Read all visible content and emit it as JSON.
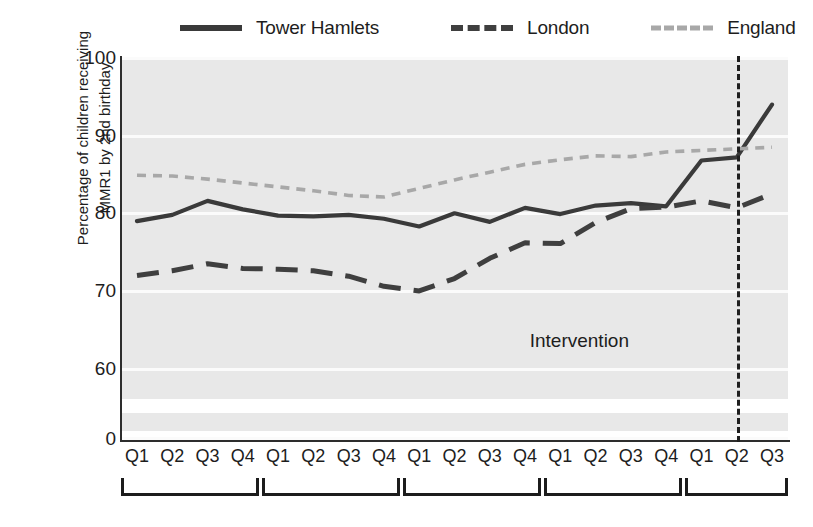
{
  "legend": {
    "entries": [
      {
        "label": "Tower Hamlets",
        "style": "solid",
        "color": "#3a3a3a",
        "icon": "solid-line-swatch"
      },
      {
        "label": "London",
        "style": "dashed",
        "color": "#3f3f3f",
        "icon": "dashed-line-swatch"
      },
      {
        "label": "England",
        "style": "dotted",
        "color": "#a8a8a8",
        "icon": "dotted-line-swatch"
      }
    ]
  },
  "axis": {
    "ylabel_line1": "Percentage of children receiving",
    "ylabel_line2": "MMR1 by 2nd birthday",
    "yticks": [
      "100",
      "90",
      "80",
      "70",
      "60",
      "0"
    ],
    "xticks": [
      "Q1",
      "Q2",
      "Q3",
      "Q4",
      "Q1",
      "Q2",
      "Q3",
      "Q4",
      "Q1",
      "Q2",
      "Q3",
      "Q4",
      "Q1",
      "Q2",
      "Q3",
      "Q4",
      "Q1",
      "Q2",
      "Q3"
    ]
  },
  "annotations": {
    "intervention_label": "Intervention"
  },
  "chart_data": {
    "type": "line",
    "title": "",
    "xlabel": "",
    "ylabel": "Percentage of children receiving MMR1 by 2nd birthday",
    "ylim": [
      57.5,
      100
    ],
    "ytick_values": [
      100,
      90,
      80,
      70,
      60,
      0
    ],
    "axis_break": {
      "between": [
        0,
        60
      ],
      "note": "y-axis broken between 0 and 60"
    },
    "grid": true,
    "grid_color": "#fbfbfb",
    "plot_background": "#e8e8e8",
    "legend_position": "top",
    "x": [
      "Q1",
      "Q2",
      "Q3",
      "Q4",
      "Q1",
      "Q2",
      "Q3",
      "Q4",
      "Q1",
      "Q2",
      "Q3",
      "Q4",
      "Q1",
      "Q2",
      "Q3",
      "Q4",
      "Q1",
      "Q2",
      "Q3"
    ],
    "annotations": [
      {
        "text": "Intervention",
        "type": "vline",
        "x_index": 17.0,
        "label_x_index": 13.4,
        "label_y": 65.5,
        "style": "dashed",
        "color": "#1f1f1f"
      }
    ],
    "series": [
      {
        "name": "Tower Hamlets",
        "style": "solid",
        "color": "#3a3a3a",
        "values": [
          79.0,
          79.8,
          81.6,
          80.5,
          79.7,
          79.6,
          79.8,
          79.3,
          78.3,
          80.0,
          78.9,
          80.7,
          79.9,
          81.0,
          81.3,
          80.9,
          86.8,
          87.2,
          94.0
        ]
      },
      {
        "name": "London",
        "style": "dashed",
        "color": "#3f3f3f",
        "values": [
          72.0,
          72.6,
          73.5,
          72.9,
          72.8,
          72.6,
          71.9,
          70.6,
          70.0,
          71.6,
          74.2,
          76.2,
          76.1,
          78.8,
          80.6,
          80.8,
          81.6,
          80.7,
          82.5
        ]
      },
      {
        "name": "England",
        "style": "dotted",
        "color": "#a8a8a8",
        "values": [
          84.9,
          84.8,
          84.4,
          83.9,
          83.4,
          82.9,
          82.3,
          82.1,
          83.2,
          84.3,
          85.3,
          86.3,
          86.9,
          87.4,
          87.3,
          87.9,
          88.1,
          88.3,
          88.5
        ]
      }
    ],
    "year_groups": [
      {
        "start_index": 0,
        "end_index": 3
      },
      {
        "start_index": 4,
        "end_index": 7
      },
      {
        "start_index": 8,
        "end_index": 11
      },
      {
        "start_index": 12,
        "end_index": 15
      },
      {
        "start_index": 16,
        "end_index": 18
      }
    ]
  }
}
